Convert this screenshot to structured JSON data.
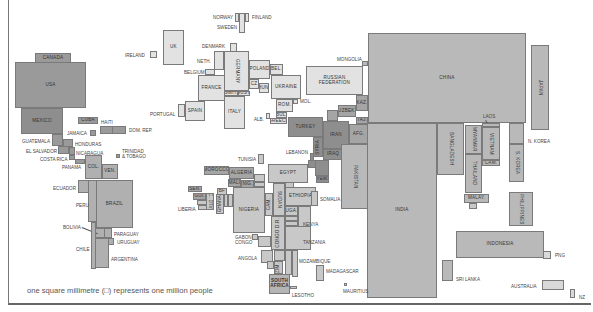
{
  "map": {
    "type": "population cartogram",
    "footer": "one square millimetre (□) represents one million people",
    "colors": {
      "europe": "#e2e2e2",
      "americas_dark": "#9a9a9a",
      "americas_mid": "#b0b0b0",
      "africa": "#c8c8c8",
      "asia": "#b9b9b9",
      "middle_east": "#8e8e8e",
      "oceania": "#d9d9d9",
      "border": "#7a7a7a"
    },
    "countries": {
      "canada": "CANADA",
      "usa": "USA",
      "mexico": "MEXICO",
      "cuba": "CUBA",
      "haiti": "HAITI",
      "dom_rep": "DOM. REP.",
      "jamaica": "JAMAICA",
      "guatemala": "GUATEMALA",
      "honduras": "HONDURAS",
      "el_salvador": "EL SALVADOR",
      "nicaragua": "NICARAGUA",
      "costa_rica": "COSTA RICA",
      "panama": "PANAMA",
      "trinidad": "TRINIDAD\n& TOBAGO",
      "col": "COL.",
      "ven": "VEN.",
      "ecuador": "ECUADOR",
      "peru": "PERU",
      "brazil": "BRAZIL",
      "bolivia": "BOLIVIA",
      "paraguay": "PARAGUAY",
      "uruguay": "URUGUAY",
      "chile": "CHILE",
      "argentina": "ARGENTINA",
      "ireland": "IRELAND",
      "uk": "UK",
      "norway": "NORWAY",
      "finland": "FINLAND",
      "sweden": "SWEDEN",
      "denmark": "DENMARK",
      "neth": "NETH.",
      "belgium": "BELGIUM",
      "germany": "GERMANY",
      "poland": "POLAND",
      "bel": "BEL.",
      "france": "FRANCE",
      "cz": "CZ",
      "hun": "HUN.",
      "ukraine": "UKRAINE",
      "switz": "SWIT.",
      "aust": "AUST.",
      "portugal": "PORTUGAL",
      "spain": "SPAIN",
      "italy": "ITALY",
      "rom": "ROM.",
      "mol": "MOL.",
      "bul": "BUL.",
      "greece": "GREECE",
      "alb": "ALB.",
      "russia": "RUSSIAN\nFEDERATION",
      "mongolia": "MONGOLIA",
      "kaz": "KAZ.",
      "uzbek": "UZBEK.",
      "taj": "TAJ.",
      "turkey": "TURKEY",
      "iran": "IRAN",
      "afg": "AFG.",
      "syria": "SYRIA",
      "iraq": "IRAQ",
      "lebanon": "LEBANON",
      "saudi": "S.",
      "yem": "YEM.",
      "china": "CHINA",
      "nepal": "NEPAL",
      "pakistan": "PAKISTAN",
      "india": "INDIA",
      "bangladesh": "BANGLADESH",
      "myanmar": "MYANMAR",
      "thailand": "THAILAND",
      "laos": "LAOS",
      "vietnam": "VIETNAM",
      "cam": "CAM.",
      "malay": "MALAY.",
      "japan": "JAPAN",
      "n_korea": "N. KOREA",
      "s_korea": "S. KOREA",
      "philippines": "PHILIPPINES",
      "indonesia": "INDONESIA",
      "png": "PNG",
      "sri_lanka": "SRI LANKA",
      "australia": "AUSTRALIA",
      "nz": "NZ",
      "tunisia": "TUNISIA",
      "morocco": "MOROCCO",
      "algeria": "ALGERIA",
      "egypt": "EGYPT",
      "mali": "MALI",
      "nig": "NIG.",
      "sen": "SEN.",
      "gui": "GUI.",
      "liberia": "LIBERIA",
      "bf": "BF",
      "cdi": "C. D'IV.",
      "ghana": "GHANA",
      "nigeria": "NIGERIA",
      "cam_af": "CAM.",
      "sudan": "SUDAN",
      "ethiopia": "ETHIOPIA",
      "somalia": "SOMALIA",
      "uga": "UGA.",
      "kenya": "KENYA",
      "gabon": "GABON",
      "congo": "CONGO",
      "congo_dr": "CONGO D.R.",
      "tanzania": "TANZANIA",
      "angola": "ANGOLA",
      "zim": "ZIM.",
      "mozambique": "MOZAMBIQUE",
      "madagascar": "MADAGASCAR",
      "mauritius": "MAURITIUS",
      "south_africa": "SOUTH\nAFRICA",
      "lesotho": "LESOTHO"
    }
  }
}
